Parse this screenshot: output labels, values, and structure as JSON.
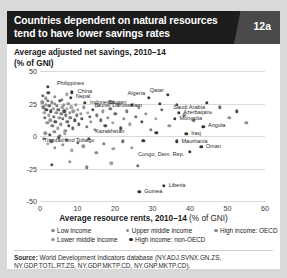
{
  "header": {
    "title": "Countries dependent on natural resources tend to have lower savings rates",
    "badge": "12a"
  },
  "subtitle": "Average adjusted net savings, 2010–14",
  "y_unit": "(% of GNI)",
  "xaxis_title": "Average resource rents, 2010–14 ",
  "xaxis_unit": "(% of GNI)",
  "legend": {
    "rows": [
      [
        {
          "label": "Low income",
          "color": "#8c8c8c"
        },
        {
          "label": "Upper middle income",
          "color": "#8c8c8c"
        },
        {
          "label": "High income: OECD",
          "color": "#8c8c8c"
        }
      ],
      [
        {
          "label": "Lower middle income",
          "color": "#9a9a9a"
        },
        {
          "label": "High income: non-OECD",
          "color": "#2f2f2f"
        }
      ]
    ]
  },
  "source": {
    "label": "Source:",
    "text": " World Development Indicators database (NY.ADJ.SVNX.GN.ZS, NY.GDP.TOTL.RT.ZS, NY.GDP.MKTP.CD, NY.GNP.MKTP.CD)."
  },
  "chart_data": {
    "type": "scatter",
    "title": "Countries dependent on natural resources tend to have lower savings rates",
    "xlabel": "Average resource rents, 2010-14 (% of GNI)",
    "ylabel": "Average adjusted net savings, 2010-14 (% of GNI)",
    "xlim": [
      0,
      60
    ],
    "ylim": [
      -50,
      50
    ],
    "xticks": [
      0,
      10,
      20,
      30,
      40,
      50,
      60
    ],
    "yticks": [
      50,
      25,
      0,
      -25,
      -50
    ],
    "grid": "horizontal",
    "legend_position": "below-axis",
    "series": [
      {
        "name": "Low income",
        "color": "#8c8c8c"
      },
      {
        "name": "Lower middle income",
        "color": "#9a9a9a"
      },
      {
        "name": "Upper middle income",
        "color": "#8c8c8c"
      },
      {
        "name": "High income: non-OECD",
        "color": "#2f2f2f"
      },
      {
        "name": "High income: OECD",
        "color": "#8c8c8c"
      }
    ],
    "labeled_points": [
      {
        "label": "Philippines",
        "x": 2.0,
        "y": 38.0,
        "lx": 4.5,
        "ly": 40.5,
        "leader": true
      },
      {
        "label": "China",
        "x": 8.5,
        "y": 33.5,
        "lx": 10.0,
        "ly": 35.0
      },
      {
        "label": "Nepal",
        "x": 8.2,
        "y": 29.5,
        "lx": 9.5,
        "ly": 31.0
      },
      {
        "label": "Indonesia",
        "x": 12.0,
        "y": 25.5,
        "lx": 13.3,
        "ly": 26.5
      },
      {
        "label": "Bhutan",
        "x": 24.5,
        "y": 24.0,
        "lx": 23.0,
        "ly": 26.5
      },
      {
        "label": "Algeria",
        "x": 29.0,
        "y": 29.5,
        "lx": 28.0,
        "ly": 33.0
      },
      {
        "label": "Qatar",
        "x": 34.0,
        "y": 31.5,
        "lx": 33.0,
        "ly": 35.5
      },
      {
        "label": "Brunei Darussalam",
        "x": 32.0,
        "y": 25.0,
        "lx": 27.2,
        "ly": 23.5
      },
      {
        "label": "Saudi Arabia",
        "x": 44.5,
        "y": 25.5,
        "lx": 44.0,
        "ly": 22.0
      },
      {
        "label": "Azerbaijan",
        "x": 37.0,
        "y": 18.0,
        "lx": 38.2,
        "ly": 18.5
      },
      {
        "label": "Mongolia",
        "x": 36.0,
        "y": 13.0,
        "lx": 37.2,
        "ly": 13.5
      },
      {
        "label": "Angola",
        "x": 43.5,
        "y": 7.0,
        "lx": 44.8,
        "ly": 8.5
      },
      {
        "label": "Kazakhstan",
        "x": 31.0,
        "y": 2.5,
        "lx": 22.5,
        "ly": 3.5
      },
      {
        "label": "Iraq",
        "x": 39.0,
        "y": 1.5,
        "lx": 40.3,
        "ly": 2.0
      },
      {
        "label": "Trinidad and Tobago",
        "x": 27.5,
        "y": -3.5,
        "lx": 14.5,
        "ly": -2.8
      },
      {
        "label": "Mauritania",
        "x": 36.5,
        "y": -4.0,
        "lx": 37.7,
        "ly": -3.5
      },
      {
        "label": "Oman",
        "x": 43.0,
        "y": -8.5,
        "lx": 44.2,
        "ly": -8.0
      },
      {
        "label": "Congo, Dem. Rep.",
        "x": 40.0,
        "y": -12.0,
        "lx": 38.5,
        "ly": -13.5
      },
      {
        "label": "Liberia",
        "x": 33.0,
        "y": -38.5,
        "lx": 34.3,
        "ly": -38.0
      },
      {
        "label": "Guinea",
        "x": 26.5,
        "y": -43.0,
        "lx": 27.8,
        "ly": -42.5
      }
    ],
    "points": [
      [
        0.6,
        26
      ],
      [
        0.9,
        22
      ],
      [
        1.1,
        18
      ],
      [
        1.3,
        14
      ],
      [
        1.5,
        24
      ],
      [
        1.7,
        20
      ],
      [
        1.9,
        10
      ],
      [
        2.1,
        27
      ],
      [
        2.3,
        16
      ],
      [
        2.5,
        23
      ],
      [
        2.7,
        12
      ],
      [
        2.9,
        19
      ],
      [
        3.1,
        26
      ],
      [
        3.3,
        8
      ],
      [
        3.5,
        21
      ],
      [
        3.7,
        15
      ],
      [
        3.9,
        25
      ],
      [
        4.1,
        11
      ],
      [
        4.3,
        18
      ],
      [
        4.5,
        23
      ],
      [
        4.7,
        6
      ],
      [
        4.9,
        20
      ],
      [
        5.1,
        14
      ],
      [
        5.3,
        27
      ],
      [
        5.5,
        9
      ],
      [
        5.7,
        17
      ],
      [
        5.9,
        22
      ],
      [
        6.1,
        13
      ],
      [
        6.3,
        24
      ],
      [
        6.5,
        19
      ],
      [
        6.7,
        4
      ],
      [
        6.9,
        16
      ],
      [
        7.1,
        21
      ],
      [
        7.3,
        11
      ],
      [
        7.5,
        25
      ],
      [
        7.7,
        8
      ],
      [
        7.9,
        18
      ],
      [
        8.1,
        14
      ],
      [
        8.3,
        22
      ],
      [
        8.7,
        6
      ],
      [
        8.9,
        19
      ],
      [
        9.2,
        12
      ],
      [
        9.5,
        24
      ],
      [
        9.8,
        16
      ],
      [
        10.1,
        20
      ],
      [
        10.4,
        9
      ],
      [
        10.8,
        17
      ],
      [
        11.2,
        13
      ],
      [
        11.6,
        22
      ],
      [
        12.4,
        7
      ],
      [
        12.8,
        18
      ],
      [
        13.2,
        15
      ],
      [
        13.6,
        11
      ],
      [
        14.1,
        20
      ],
      [
        14.6,
        5
      ],
      [
        15.1,
        16
      ],
      [
        15.6,
        23
      ],
      [
        16.2,
        12
      ],
      [
        16.8,
        19
      ],
      [
        17.4,
        8
      ],
      [
        18.0,
        14
      ],
      [
        18.7,
        21
      ],
      [
        19.4,
        10
      ],
      [
        20.1,
        17
      ],
      [
        20.9,
        25
      ],
      [
        21.6,
        6
      ],
      [
        22.4,
        13
      ],
      [
        23.2,
        19
      ],
      [
        24.0,
        9
      ],
      [
        25.5,
        15
      ],
      [
        26.3,
        22
      ],
      [
        27.1,
        11
      ],
      [
        28.2,
        17
      ],
      [
        29.5,
        5
      ],
      [
        30.8,
        13
      ],
      [
        32.5,
        20
      ],
      [
        34.5,
        8
      ],
      [
        36.5,
        24
      ],
      [
        38.5,
        16
      ],
      [
        41.0,
        12
      ],
      [
        45.5,
        18
      ],
      [
        48.0,
        22
      ],
      [
        50.5,
        14
      ],
      [
        52.5,
        19
      ],
      [
        55.0,
        10
      ],
      [
        1.0,
        -2
      ],
      [
        2.0,
        -6
      ],
      [
        3.0,
        -4
      ],
      [
        4.0,
        -9
      ],
      [
        5.0,
        -1
      ],
      [
        6.0,
        -7
      ],
      [
        7.0,
        -3
      ],
      [
        8.5,
        -11
      ],
      [
        10.0,
        -5
      ],
      [
        11.5,
        -8
      ],
      [
        13.0,
        -2
      ],
      [
        15.0,
        -13
      ],
      [
        17.0,
        -6
      ],
      [
        19.5,
        -10
      ],
      [
        22.0,
        -4
      ],
      [
        24.5,
        -9
      ],
      [
        3.2,
        -22
      ],
      [
        8.0,
        -20
      ],
      [
        12.5,
        -24
      ],
      [
        19.0,
        -21
      ],
      [
        26.0,
        -23
      ],
      [
        1.4,
        2
      ],
      [
        2.6,
        1
      ],
      [
        3.8,
        3
      ],
      [
        5.2,
        0
      ],
      [
        6.6,
        2
      ],
      [
        0.8,
        31
      ],
      [
        1.6,
        29
      ],
      [
        2.2,
        33
      ],
      [
        4.0,
        30
      ],
      [
        5.8,
        28
      ],
      [
        7.2,
        32
      ]
    ]
  }
}
